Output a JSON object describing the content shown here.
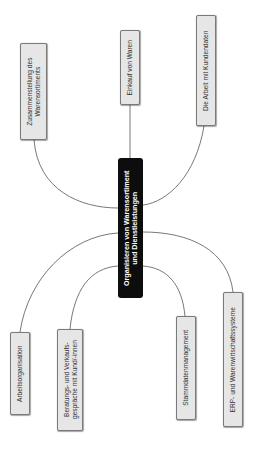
{
  "diagram": {
    "type": "mind-map",
    "orientation": "rotated-90-ccw",
    "root": {
      "lines": [
        "Organisieren von Warensortiment",
        "und Dienstleistungen"
      ],
      "bg_color": "#0d0d0d",
      "text_color": "#ffffff"
    },
    "branches": [
      {
        "id": "zusammenstellung",
        "lines": [
          "Zusammenstellung des",
          "Warensortiments"
        ],
        "side": "top"
      },
      {
        "id": "einkauf",
        "lines": [
          "Einkauf von Waren"
        ],
        "side": "top"
      },
      {
        "id": "kundendaten",
        "lines": [
          "Die Arbeit mit Kundendaten"
        ],
        "side": "top"
      },
      {
        "id": "arbeitsorganisation",
        "lines": [
          "Arbeitsorganisation"
        ],
        "side": "bottom"
      },
      {
        "id": "beratung",
        "lines": [
          "Beratungs- und Verkaufs-",
          "gespräche mit Kund/-innen"
        ],
        "side": "bottom"
      },
      {
        "id": "stammdaten",
        "lines": [
          "Stammdatenmanagement"
        ],
        "side": "bottom"
      },
      {
        "id": "erp",
        "lines": [
          "ERP- und Warenwirtschaftssysteme"
        ],
        "side": "bottom"
      }
    ],
    "colors": {
      "leaf_bg": "#e6e6e6",
      "leaf_border": "#7a7a7a",
      "link": "#555555"
    }
  }
}
